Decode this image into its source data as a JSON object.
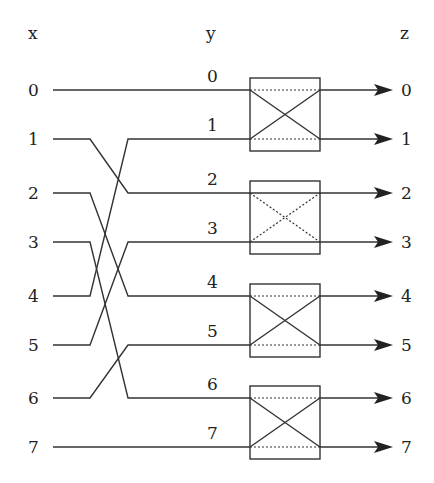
{
  "headers": {
    "x": "x",
    "y": "y",
    "z": "z"
  },
  "rows": [
    {
      "index": 0,
      "x_label": "0",
      "y_label": "0",
      "z_label": "0",
      "y": 90
    },
    {
      "index": 1,
      "x_label": "1",
      "y_label": "1",
      "z_label": "1",
      "y": 139
    },
    {
      "index": 2,
      "x_label": "2",
      "y_label": "2",
      "z_label": "2",
      "y": 193
    },
    {
      "index": 3,
      "x_label": "3",
      "y_label": "3",
      "z_label": "3",
      "y": 242
    },
    {
      "index": 4,
      "x_label": "4",
      "y_label": "4",
      "z_label": "4",
      "y": 296
    },
    {
      "index": 5,
      "x_label": "5",
      "y_label": "5",
      "z_label": "5",
      "y": 345
    },
    {
      "index": 6,
      "x_label": "6",
      "y_label": "6",
      "z_label": "6",
      "y": 398
    },
    {
      "index": 7,
      "x_label": "7",
      "y_label": "7",
      "z_label": "7",
      "y": 447
    }
  ],
  "wiring_x_to_y": [
    {
      "from": 0,
      "to": 0
    },
    {
      "from": 1,
      "to": 2
    },
    {
      "from": 2,
      "to": 4
    },
    {
      "from": 3,
      "to": 6
    },
    {
      "from": 4,
      "to": 1
    },
    {
      "from": 5,
      "to": 3
    },
    {
      "from": 6,
      "to": 5
    },
    {
      "from": 7,
      "to": 7
    }
  ],
  "switches": [
    {
      "inputs": [
        0,
        1
      ],
      "state": "cross",
      "solid": "diagonals",
      "dotted": "straight"
    },
    {
      "inputs": [
        2,
        3
      ],
      "state": "straight",
      "solid": "straight",
      "dotted": "diagonals"
    },
    {
      "inputs": [
        4,
        5
      ],
      "state": "cross",
      "solid": "diagonals",
      "dotted": "straight"
    },
    {
      "inputs": [
        6,
        7
      ],
      "state": "cross",
      "solid": "diagonals",
      "dotted": "straight"
    }
  ]
}
